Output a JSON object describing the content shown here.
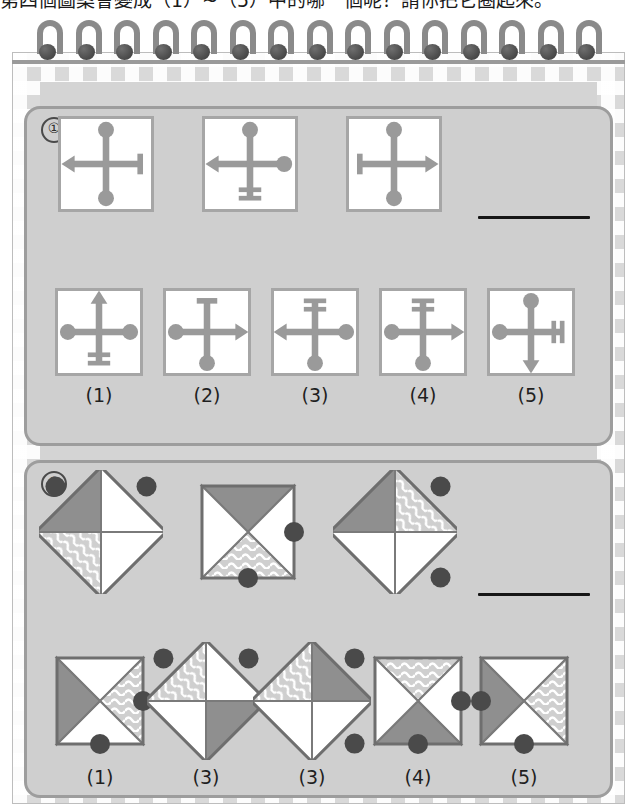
{
  "question": {
    "text": "第四個圖案會變成（1）~（5）中的哪一個呢？請你把它圈起來。"
  },
  "colors": {
    "page_bg": "#d4d4d4",
    "panel_bg": "#cfcfcf",
    "panel_border": "#9d9d9d",
    "card_bg": "#ffffff",
    "card_border": "#a6a6a6",
    "figure_gray": "#9a9a9a",
    "dark_gray_fill": "#8f8f8f",
    "wave_fill": "#cfcfcf",
    "dot_fill": "#4a4a4a",
    "gingham": "#d9d9d9",
    "coil": "#8a8a8a",
    "answer_line": "#161616"
  },
  "section1": {
    "number": "①",
    "sequence": [
      {
        "name": "cross-a",
        "up": "ball",
        "down": "ball",
        "left": "arrow",
        "right": "bar"
      },
      {
        "name": "cross-b",
        "up": "ball",
        "down": "double-bar",
        "left": "arrow",
        "right": "ball"
      },
      {
        "name": "cross-c",
        "up": "ball",
        "down": "ball",
        "left": "bar",
        "right": "arrow"
      }
    ],
    "answer_blank": true,
    "options": [
      {
        "label": "(1)",
        "name": "cross-option-1",
        "up": "arrow",
        "down": "double-bar",
        "left": "ball",
        "right": "ball"
      },
      {
        "label": "(2)",
        "name": "cross-option-2",
        "up": "bar",
        "down": "ball",
        "left": "ball",
        "right": "arrow"
      },
      {
        "label": "(3)",
        "name": "cross-option-3",
        "up": "double-bar",
        "down": "ball",
        "left": "arrow",
        "right": "ball"
      },
      {
        "label": "(4)",
        "name": "cross-option-4",
        "up": "double-bar",
        "down": "ball",
        "left": "ball",
        "right": "arrow"
      },
      {
        "label": "(5)",
        "name": "cross-option-5",
        "up": "ball",
        "down": "arrow",
        "left": "ball",
        "right": "double-bar"
      }
    ]
  },
  "section2": {
    "number": "②",
    "sequence": [
      {
        "name": "quad-a",
        "rotated": true,
        "quadrants": {
          "top": "white",
          "right": "white",
          "bottom": "wave",
          "left": "gray"
        },
        "dots": [
          "top-left",
          "top-right"
        ]
      },
      {
        "name": "quad-b",
        "rotated": false,
        "quadrants": {
          "top": "gray",
          "right": "white",
          "bottom": "wave",
          "left": "white"
        },
        "dots": [
          "right",
          "bottom"
        ]
      },
      {
        "name": "quad-c",
        "rotated": true,
        "quadrants": {
          "top": "wave",
          "right": "white",
          "bottom": "white",
          "left": "gray"
        },
        "dots": [
          "top-right",
          "bottom-right"
        ]
      }
    ],
    "answer_blank": true,
    "options": [
      {
        "label": "(1)",
        "name": "quad-option-1",
        "rotated": false,
        "quadrants": {
          "top": "white",
          "right": "wave",
          "bottom": "white",
          "left": "gray"
        },
        "dots": [
          "right",
          "bottom"
        ]
      },
      {
        "label": "(3)",
        "name": "quad-option-2",
        "rotated": true,
        "quadrants": {
          "top": "white",
          "right": "gray",
          "bottom": "white",
          "left": "wave"
        },
        "dots": [
          "top-left",
          "top-right"
        ]
      },
      {
        "label": "(3)",
        "name": "quad-option-3",
        "rotated": true,
        "quadrants": {
          "top": "gray",
          "right": "white",
          "bottom": "white",
          "left": "wave"
        },
        "dots": [
          "top-right",
          "bottom-right"
        ]
      },
      {
        "label": "(4)",
        "name": "quad-option-4",
        "rotated": false,
        "quadrants": {
          "top": "wave",
          "right": "white",
          "bottom": "gray",
          "left": "white"
        },
        "dots": [
          "right",
          "bottom"
        ]
      },
      {
        "label": "(5)",
        "name": "quad-option-5",
        "rotated": false,
        "quadrants": {
          "top": "white",
          "right": "wave",
          "bottom": "white",
          "left": "gray"
        },
        "dots": [
          "left",
          "bottom"
        ]
      }
    ]
  }
}
